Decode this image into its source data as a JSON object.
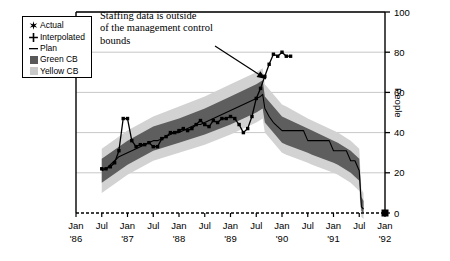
{
  "chart_data": {
    "type": "area",
    "title": "",
    "xlabel": "",
    "ylabel": "People",
    "ylim": [
      0,
      100
    ],
    "ytick_values": [
      0,
      20,
      40,
      60,
      80,
      100
    ],
    "ytick_labels": [
      "0",
      "20",
      "40",
      "60",
      "80",
      "100"
    ],
    "y_axis_position": "right",
    "grid": true,
    "legend_position": "top-left",
    "xtick_labels": [
      {
        "month": "Jan",
        "year": "'86"
      },
      {
        "month": "Jul",
        "year": ""
      },
      {
        "month": "Jan",
        "year": "'87"
      },
      {
        "month": "Jul",
        "year": ""
      },
      {
        "month": "Jan",
        "year": "'88"
      },
      {
        "month": "Jul",
        "year": ""
      },
      {
        "month": "Jan",
        "year": "'89"
      },
      {
        "month": "Jul",
        "year": ""
      },
      {
        "month": "Jan",
        "year": "'90"
      },
      {
        "month": "Jul",
        "year": ""
      },
      {
        "month": "Jan",
        "year": "'91"
      },
      {
        "month": "Jul",
        "year": ""
      },
      {
        "month": "Jan",
        "year": "'92"
      }
    ],
    "x_range_months": [
      0,
      72
    ],
    "annotations": [
      {
        "text": "Staffing data is outside of the management control bounds",
        "lines": [
          "Staffing data is outside",
          "of the management control",
          "bounds"
        ],
        "arrow_from": [
          215,
          46
        ],
        "arrow_to": [
          266,
          79
        ]
      }
    ],
    "legend": [
      {
        "label": "Actual",
        "marker": "star",
        "color": "#000000"
      },
      {
        "label": "Interpolated",
        "marker": "plus",
        "color": "#000000"
      },
      {
        "label": "Plan",
        "marker": "dash",
        "color": "#000000"
      },
      {
        "label": "Green CB",
        "marker": "swatch",
        "color": "#585858"
      },
      {
        "label": "Yellow CB",
        "marker": "swatch",
        "color": "#c9c9c9"
      }
    ],
    "series": [
      {
        "name": "Plan",
        "type": "line",
        "color": "#000000",
        "points": [
          [
            6,
            21
          ],
          [
            7,
            22
          ],
          [
            8,
            24
          ],
          [
            9,
            26
          ],
          [
            10,
            28
          ],
          [
            11,
            29
          ],
          [
            12,
            30
          ],
          [
            13,
            31
          ],
          [
            14,
            32
          ],
          [
            15,
            33
          ],
          [
            16,
            34
          ],
          [
            17,
            35
          ],
          [
            18,
            36
          ],
          [
            19,
            36
          ],
          [
            20,
            37
          ],
          [
            21,
            38
          ],
          [
            22,
            39
          ],
          [
            23,
            40
          ],
          [
            24,
            40
          ],
          [
            25,
            41
          ],
          [
            26,
            42
          ],
          [
            27,
            43
          ],
          [
            28,
            44
          ],
          [
            29,
            44
          ],
          [
            30,
            45
          ],
          [
            31,
            46
          ],
          [
            32,
            47
          ],
          [
            33,
            48
          ],
          [
            34,
            49
          ],
          [
            35,
            50
          ],
          [
            36,
            51
          ],
          [
            37,
            52
          ],
          [
            38,
            53
          ],
          [
            39,
            54
          ],
          [
            40,
            55
          ],
          [
            41,
            56
          ],
          [
            42,
            57
          ],
          [
            43,
            58
          ],
          [
            43.5,
            59
          ],
          [
            44,
            52
          ],
          [
            45,
            48
          ],
          [
            46,
            45
          ],
          [
            47,
            43
          ],
          [
            48,
            41
          ],
          [
            49,
            41
          ],
          [
            50,
            41
          ],
          [
            51,
            41
          ],
          [
            52,
            41
          ],
          [
            53,
            41
          ],
          [
            54,
            36
          ],
          [
            55,
            36
          ],
          [
            56,
            36
          ],
          [
            57,
            36
          ],
          [
            58,
            36
          ],
          [
            59,
            36
          ],
          [
            60,
            31
          ],
          [
            61,
            31
          ],
          [
            62,
            31
          ],
          [
            63,
            31
          ],
          [
            64,
            26
          ],
          [
            65,
            26
          ],
          [
            66,
            21
          ],
          [
            66.5,
            3
          ],
          [
            67,
            2
          ]
        ]
      },
      {
        "name": "Actual",
        "type": "line-markers",
        "color": "#000000",
        "points": [
          [
            6,
            22
          ],
          [
            7,
            22
          ],
          [
            8,
            23
          ],
          [
            9,
            25
          ],
          [
            10,
            31
          ],
          [
            11,
            47
          ],
          [
            12,
            47
          ],
          [
            13,
            36
          ],
          [
            14,
            33
          ],
          [
            15,
            34
          ],
          [
            16,
            34
          ],
          [
            17,
            35
          ],
          [
            18,
            33
          ],
          [
            19,
            33
          ],
          [
            20,
            37
          ],
          [
            21,
            38
          ],
          [
            22,
            40
          ],
          [
            23,
            40
          ],
          [
            24,
            41
          ],
          [
            25,
            42
          ],
          [
            26,
            41
          ],
          [
            27,
            42
          ],
          [
            28,
            44
          ],
          [
            29,
            46
          ],
          [
            30,
            44
          ],
          [
            31,
            43
          ],
          [
            32,
            46
          ],
          [
            33,
            45
          ],
          [
            34,
            47
          ],
          [
            35,
            47
          ],
          [
            36,
            48
          ],
          [
            37,
            47
          ],
          [
            38,
            44
          ],
          [
            39,
            40
          ],
          [
            40,
            42
          ],
          [
            41,
            48
          ],
          [
            42,
            57
          ],
          [
            43,
            62
          ],
          [
            44,
            68
          ],
          [
            45,
            74
          ],
          [
            46,
            79
          ],
          [
            47,
            78
          ],
          [
            48,
            80
          ],
          [
            49,
            78
          ],
          [
            50,
            78
          ]
        ]
      }
    ],
    "bands": [
      {
        "name": "Yellow CB",
        "color": "#d2d2d2",
        "upper": [
          [
            6,
            32
          ],
          [
            12,
            41
          ],
          [
            18,
            48
          ],
          [
            24,
            53
          ],
          [
            30,
            58
          ],
          [
            36,
            64
          ],
          [
            42,
            70
          ],
          [
            43.5,
            72
          ],
          [
            44,
            64
          ],
          [
            48,
            54
          ],
          [
            49,
            53
          ],
          [
            54,
            47
          ],
          [
            55,
            46
          ],
          [
            60,
            41
          ],
          [
            61,
            40
          ],
          [
            64,
            36
          ],
          [
            66,
            32
          ],
          [
            66.5,
            12
          ],
          [
            67,
            10
          ]
        ],
        "lower": [
          [
            6,
            10
          ],
          [
            12,
            19
          ],
          [
            18,
            26
          ],
          [
            24,
            30
          ],
          [
            30,
            34
          ],
          [
            36,
            39
          ],
          [
            42,
            45
          ],
          [
            43.5,
            47
          ],
          [
            44,
            40
          ],
          [
            48,
            30
          ],
          [
            49,
            29
          ],
          [
            54,
            25
          ],
          [
            55,
            24
          ],
          [
            60,
            20
          ],
          [
            61,
            19
          ],
          [
            64,
            15
          ],
          [
            66,
            11
          ],
          [
            66.5,
            -2
          ],
          [
            67,
            -3
          ]
        ]
      },
      {
        "name": "Green CB",
        "color": "#5e5e5e",
        "upper": [
          [
            6,
            27
          ],
          [
            12,
            36
          ],
          [
            18,
            43
          ],
          [
            24,
            47
          ],
          [
            30,
            52
          ],
          [
            36,
            58
          ],
          [
            42,
            64
          ],
          [
            43.5,
            66
          ],
          [
            44,
            58
          ],
          [
            48,
            48
          ],
          [
            49,
            47
          ],
          [
            54,
            42
          ],
          [
            55,
            41
          ],
          [
            60,
            36
          ],
          [
            61,
            35
          ],
          [
            64,
            31
          ],
          [
            66,
            27
          ],
          [
            66.5,
            8
          ],
          [
            67,
            6
          ]
        ],
        "lower": [
          [
            6,
            15
          ],
          [
            12,
            24
          ],
          [
            18,
            31
          ],
          [
            24,
            35
          ],
          [
            30,
            39
          ],
          [
            36,
            44
          ],
          [
            42,
            50
          ],
          [
            43.5,
            52
          ],
          [
            44,
            45
          ],
          [
            48,
            35
          ],
          [
            49,
            34
          ],
          [
            54,
            30
          ],
          [
            55,
            29
          ],
          [
            60,
            25
          ],
          [
            61,
            24
          ],
          [
            64,
            20
          ],
          [
            66,
            16
          ],
          [
            66.5,
            1
          ],
          [
            67,
            0
          ]
        ]
      }
    ]
  }
}
